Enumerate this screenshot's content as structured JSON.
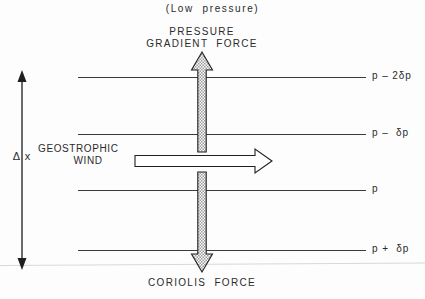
{
  "figure": {
    "title_top": "(Low  pressure)",
    "force_up_line1": "PRESSURE",
    "force_up_line2": "GRADIENT  FORCE",
    "force_down": "CORIOLIS  FORCE",
    "wind_line1": "GEOSTROPHIC",
    "wind_line2": "WIND",
    "distance_label": "Δ x"
  },
  "isobars": [
    {
      "label": "p – 2δp",
      "y": 77
    },
    {
      "label": "p –  δp",
      "y": 134
    },
    {
      "label": "p",
      "y": 190
    },
    {
      "label": "p +  δp",
      "y": 250
    }
  ],
  "colors": {
    "ink": "#2b2b2b",
    "line": "#3a3a3a",
    "arrow_outline": "#1f1f1f",
    "arrow_fill": "#b9b9b9",
    "scan_edge": "#d8d8d8",
    "background": "#fdfdfd"
  },
  "geometry": {
    "isobar_x_start": 78,
    "isobar_x_end": 366,
    "vertical_arrow_x": 202,
    "vertical_arrow_top": 52,
    "vertical_arrow_bottom": 272,
    "wind_arrow_x_start": 135,
    "wind_arrow_x_end": 272,
    "wind_arrow_y": 161,
    "delta_axis_x": 22,
    "delta_axis_top": 72,
    "delta_axis_bottom": 268
  }
}
